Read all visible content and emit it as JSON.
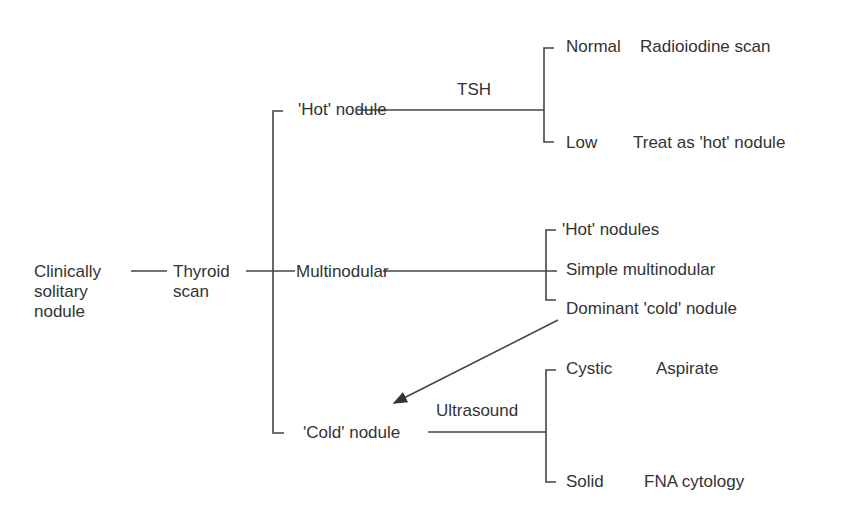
{
  "diagram": {
    "type": "flowchart",
    "root": {
      "label_lines": [
        "Clinically",
        "solitary",
        "nodule"
      ]
    },
    "scan": {
      "label_lines": [
        "Thyroid",
        "scan"
      ]
    },
    "branches": {
      "hot": {
        "label": "'Hot' nodule",
        "test": "TSH",
        "outcomes": [
          {
            "label": "Normal",
            "action": "Radioiodine scan"
          },
          {
            "label": "Low",
            "action": "Treat as 'hot' nodule"
          }
        ]
      },
      "multi": {
        "label": "Multinodular",
        "outcomes": [
          {
            "label": "'Hot' nodules"
          },
          {
            "label": "Simple multinodular"
          },
          {
            "label": "Dominant 'cold' nodule"
          }
        ]
      },
      "cold": {
        "label": "'Cold' nodule",
        "test": "Ultrasound",
        "outcomes": [
          {
            "label": "Cystic",
            "action": "Aspirate"
          },
          {
            "label": "Solid",
            "action": "FNA cytology"
          }
        ]
      }
    },
    "arrow": {
      "from": "Dominant 'cold' nodule",
      "to": "'Cold' nodule"
    }
  }
}
